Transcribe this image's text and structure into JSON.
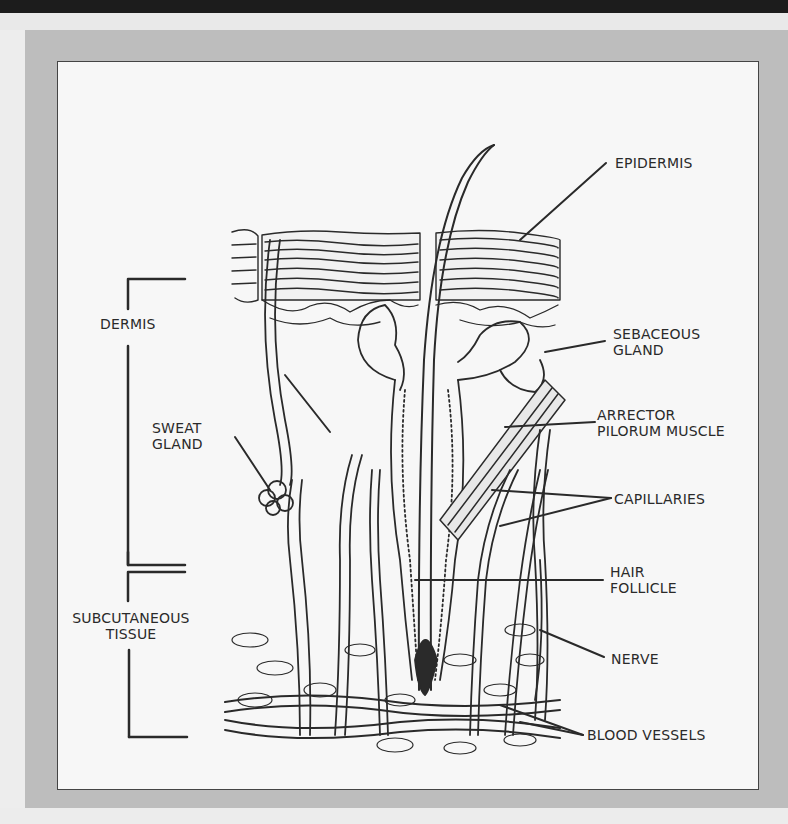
{
  "figure": {
    "type": "labelled anatomical diagram",
    "labels_left": {
      "dermis": "DERMIS",
      "sweat_gland": [
        "SWEAT",
        "GLAND"
      ],
      "subcutaneous_tissue": [
        "SUBCUTANEOUS",
        "TISSUE"
      ]
    },
    "labels_right": {
      "epidermis": "EPIDERMIS",
      "sebaceous_gland": [
        "SEBACEOUS",
        "GLAND"
      ],
      "arrector_pilorum_muscle": [
        "ARRECTOR",
        "PILORUM MUSCLE"
      ],
      "capillaries": "CAPILLARIES",
      "hair_follicle": [
        "HAIR",
        "FOLLICLE"
      ],
      "nerve": "NERVE",
      "blood_vessels": "BLOOD VESSELS"
    }
  },
  "colors": {
    "top_bar": "#1c1c1c",
    "frame": "#bdbdbd",
    "panel": "#f7f7f7",
    "ink": "#2a2a2a"
  }
}
